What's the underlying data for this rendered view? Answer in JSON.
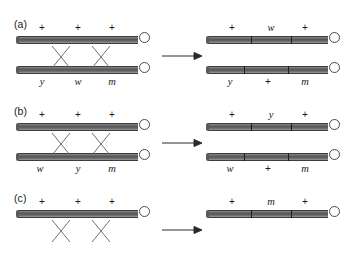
{
  "figure": {
    "arrow_glyph": "arrow-right"
  },
  "panels": [
    {
      "id": "a",
      "label": "(a)",
      "before": {
        "top_chromatid": {
          "labels_position": "above",
          "alleles": [
            "+",
            "+",
            "+"
          ]
        },
        "bottom_chromatid": {
          "labels_position": "below",
          "alleles": [
            "y",
            "w",
            "m"
          ]
        },
        "crossovers": 2
      },
      "after": {
        "top_chromatid": {
          "labels_position": "above",
          "alleles": [
            "+",
            "w",
            "+"
          ]
        },
        "bottom_chromatid": {
          "labels_position": "below",
          "alleles": [
            "y",
            "+",
            "m"
          ]
        }
      }
    },
    {
      "id": "b",
      "label": "(b)",
      "before": {
        "top_chromatid": {
          "labels_position": "above",
          "alleles": [
            "+",
            "+",
            "+"
          ]
        },
        "bottom_chromatid": {
          "labels_position": "below",
          "alleles": [
            "w",
            "y",
            "m"
          ]
        },
        "crossovers": 2
      },
      "after": {
        "top_chromatid": {
          "labels_position": "above",
          "alleles": [
            "+",
            "y",
            "+"
          ]
        },
        "bottom_chromatid": {
          "labels_position": "below",
          "alleles": [
            "w",
            "+",
            "m"
          ]
        }
      }
    },
    {
      "id": "c",
      "label": "(c)",
      "before": {
        "top_chromatid": {
          "labels_position": "above",
          "alleles": [
            "+",
            "+",
            "+"
          ]
        },
        "bottom_chromatid": {
          "labels_position": "below",
          "alleles": [
            "",
            "",
            ""
          ]
        },
        "crossovers": 2
      },
      "after": {
        "top_chromatid": {
          "labels_position": "above",
          "alleles": [
            "+",
            "m",
            "+"
          ]
        },
        "bottom_chromatid": {
          "labels_position": "below",
          "alleles": [
            "",
            "",
            ""
          ]
        }
      }
    }
  ]
}
